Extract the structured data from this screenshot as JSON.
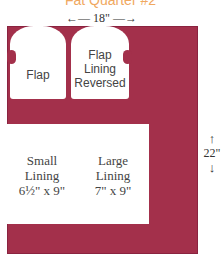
{
  "title": "Fat Quarter #2",
  "dimensions": {
    "width": "←— 18\" —→",
    "height_value": "22\"",
    "up_arrow": "↑",
    "down_arrow": "↓"
  },
  "colors": {
    "fabric": "#a3304b",
    "title": "#f0a860"
  },
  "pieces": {
    "flap": {
      "label": "Flap"
    },
    "flap_lining": {
      "line1": "Flap",
      "line2": "Lining",
      "line3": "Reversed"
    },
    "small_lining": {
      "line1": "Small",
      "line2": "Lining",
      "size": "6½\" x 9\""
    },
    "large_lining": {
      "line1": "Large",
      "line2": "Lining",
      "size": "7\" x 9\""
    }
  }
}
